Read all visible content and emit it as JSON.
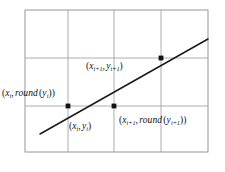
{
  "figure": {
    "title": "",
    "background_color": "#ffffff",
    "grid": {
      "border_color": "#8a8a8a",
      "line_color": "#9a9a9a",
      "x_left": 25,
      "x_right": 208,
      "y_top": 10,
      "y_bottom": 152,
      "vertical_gridlines": [
        68,
        114,
        161
      ],
      "horizontal_gridlines": [
        58,
        106
      ]
    },
    "line": {
      "color": "#1a1a1a",
      "x1": 40,
      "y1": 134,
      "x2": 208,
      "y2": 39
    },
    "points": [
      {
        "name": "point-xi-round-yi",
        "x": 68,
        "y": 106,
        "color": "#111111"
      },
      {
        "name": "point-xi1-round-yi1",
        "x": 114,
        "y": 106,
        "color": "#111111"
      },
      {
        "name": "point-xi1-yi1",
        "x": 161,
        "y": 58,
        "color": "#111111"
      }
    ],
    "labels": {
      "xi_round_yi": {
        "open": "(",
        "var1": "x",
        "sub1": "i",
        "comma": ",",
        "func": "round",
        "open2": "(",
        "var2": "y",
        "sub2": "i",
        "close2": ")",
        "close": ")",
        "plain": "(x_i, round(y_i))"
      },
      "xi1_yi1": {
        "open": "(",
        "var1": "x",
        "sub1": "i+1",
        "comma": ",",
        "var2": "y",
        "sub2": "i+1",
        "close": ")",
        "plain": "(x_i+1, y_i+1)"
      },
      "xi_yi": {
        "open": "(",
        "var1": "x",
        "sub1": "i",
        "comma": ",",
        "var2": "y",
        "sub2": "i",
        "close": ")",
        "plain": "(x_i, y_i)"
      },
      "xi1_round_yi1": {
        "open": "(",
        "var1": "x",
        "sub1": "i+1",
        "comma": ",",
        "func": "round",
        "open2": "(",
        "var2": "y",
        "sub2": "i+1",
        "close2": ")",
        "close": ")",
        "plain": "(x_i+1, round(y_i+1))"
      }
    }
  }
}
